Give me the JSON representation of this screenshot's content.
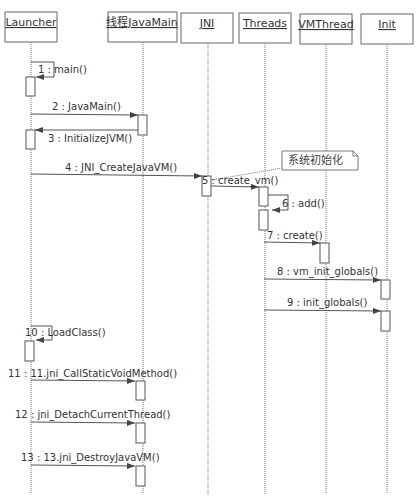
{
  "diagram": {
    "type": "UML sequence diagram",
    "note": "系统初始化",
    "participants": [
      {
        "id": "launcher",
        "label": "Launcher"
      },
      {
        "id": "javamain",
        "label": "线程JavaMain"
      },
      {
        "id": "jni",
        "label": "JNI"
      },
      {
        "id": "threads",
        "label": "Threads"
      },
      {
        "id": "vmthread",
        "label": "VMThread"
      },
      {
        "id": "init",
        "label": "Init"
      }
    ],
    "messages": [
      {
        "n": 1,
        "label": "1 : main()",
        "from": "Launcher",
        "to": "Launcher"
      },
      {
        "n": 2,
        "label": "2 : JavaMain()",
        "from": "Launcher",
        "to": "线程JavaMain"
      },
      {
        "n": 3,
        "label": "3 : InitializeJVM()",
        "from": "线程JavaMain",
        "to": "Launcher"
      },
      {
        "n": 4,
        "label": "4 : JNI_CreateJavaVM()",
        "from": "Launcher",
        "to": "JNI"
      },
      {
        "n": 5,
        "label": "5 : create_vm()",
        "from": "JNI",
        "to": "Threads"
      },
      {
        "n": 6,
        "label": "6 : add()",
        "from": "Threads",
        "to": "Threads"
      },
      {
        "n": 7,
        "label": "7 : create()",
        "from": "Threads",
        "to": "VMThread"
      },
      {
        "n": 8,
        "label": "8 : vm_init_globals()",
        "from": "Threads",
        "to": "Init"
      },
      {
        "n": 9,
        "label": "9 : init_globals()",
        "from": "Threads",
        "to": "Init"
      },
      {
        "n": 10,
        "label": "10 : LoadClass()",
        "from": "Launcher",
        "to": "Launcher"
      },
      {
        "n": 11,
        "label": "11 : 11.jni_CallStaticVoidMethod()",
        "from": "Launcher",
        "to": "线程JavaMain"
      },
      {
        "n": 12,
        "label": "12 : jni_DetachCurrentThread()",
        "from": "Launcher",
        "to": "线程JavaMain"
      },
      {
        "n": 13,
        "label": "13 : 13.jni_DestroyJavaVM()",
        "from": "Launcher",
        "to": "线程JavaMain"
      }
    ]
  }
}
